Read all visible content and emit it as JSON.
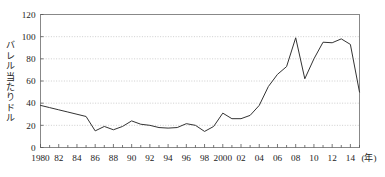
{
  "chart_data": {
    "type": "line",
    "title": "",
    "subtitle": "",
    "xlabel": "(年)",
    "ylabel": "バレル当たりドル",
    "xlim": [
      1980,
      2015
    ],
    "ylim": [
      0,
      120
    ],
    "yticks": [
      0,
      20,
      40,
      60,
      80,
      100,
      120
    ],
    "ytick_labels": [
      "0",
      "20",
      "40",
      "60",
      "80",
      "100",
      "120"
    ],
    "xticks": [
      1980,
      1982,
      1984,
      1986,
      1988,
      1990,
      1992,
      1994,
      1996,
      1998,
      2000,
      2002,
      2004,
      2006,
      2008,
      2010,
      2012,
      2014
    ],
    "xtick_labels": [
      "1980",
      "82",
      "84",
      "86",
      "88",
      "90",
      "92",
      "94",
      "96",
      "98",
      "2000",
      "02",
      "04",
      "06",
      "08",
      "10",
      "12",
      "14"
    ],
    "grid": true,
    "grid_axis": "y",
    "grid_style": "dotted",
    "legend": false,
    "legend_position": "none",
    "line_color": "#333333",
    "grid_color": "#b9b9b9",
    "axis_color": "#888888",
    "x": [
      1980,
      1981,
      1982,
      1983,
      1984,
      1985,
      1986,
      1987,
      1988,
      1989,
      1990,
      1991,
      1992,
      1993,
      1994,
      1995,
      1996,
      1997,
      1998,
      1999,
      2000,
      2001,
      2002,
      2003,
      2004,
      2005,
      2006,
      2007,
      2008,
      2009,
      2010,
      2011,
      2012,
      2013,
      2014,
      2015
    ],
    "values": [
      38,
      36,
      34,
      32,
      30,
      28,
      15,
      19,
      16,
      19,
      24,
      21,
      20,
      18,
      17.5,
      18,
      21.5,
      20,
      14.5,
      19,
      31,
      26,
      26,
      29,
      38,
      55,
      66,
      73,
      99,
      62,
      80,
      95,
      94.5,
      98,
      93,
      50
    ],
    "series": [
      {
        "name": "原油価格",
        "values": [
          38,
          36,
          34,
          32,
          30,
          28,
          15,
          19,
          16,
          19,
          24,
          21,
          20,
          18,
          17.5,
          18,
          21.5,
          20,
          14.5,
          19,
          31,
          26,
          26,
          29,
          38,
          55,
          66,
          73,
          99,
          62,
          80,
          95,
          94.5,
          98,
          93,
          50
        ]
      }
    ]
  }
}
